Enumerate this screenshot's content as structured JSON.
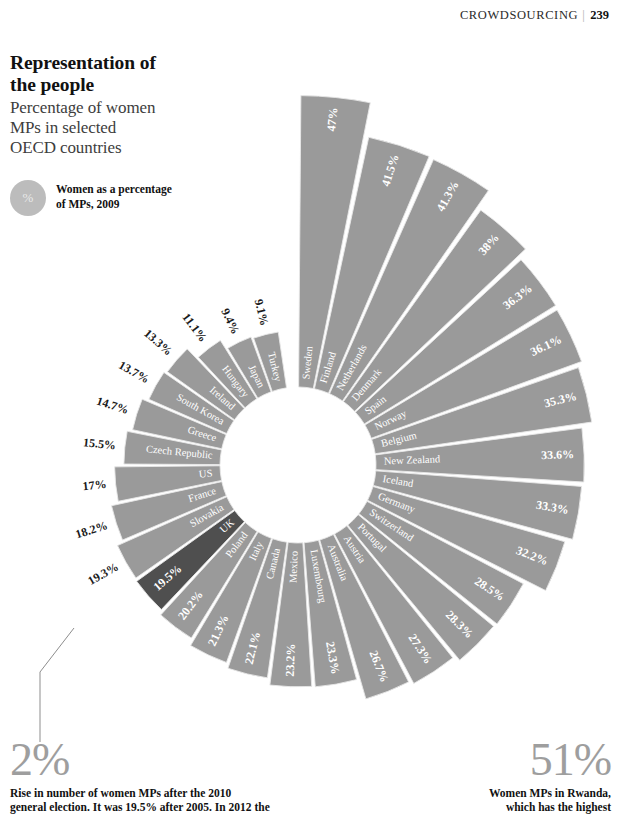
{
  "header": {
    "section": "CROWDSOURCING",
    "page": "239"
  },
  "title": {
    "main_line1": "Representation of",
    "main_line2": "the people",
    "sub_line1": "Percentage of women",
    "sub_line2": "MPs in selected",
    "sub_line3": "OECD countries"
  },
  "legend": {
    "swatch_symbol": "%",
    "line1": "Women as a percentage",
    "line2": "of MPs, 2009"
  },
  "stats": {
    "left": {
      "value": "2%",
      "line1": "Rise in number of women MPs after the 2010",
      "line2": "general election. It was 19.5% after 2005. In 2012 the"
    },
    "right": {
      "value": "51%",
      "line1": "Women MPs in Rwanda,",
      "line2": "which has the highest"
    }
  },
  "colors": {
    "segment": "#9a9a9a",
    "highlight": "#4f4f4f",
    "segment_stroke": "#e8e8e8",
    "label_light": "#ffffff",
    "label_dark": "#1a1a1a",
    "accent_gray": "#9e9e9e"
  },
  "chart_data": {
    "type": "pie",
    "variant": "radial-bar-rose",
    "title": "Representation of the people",
    "subtitle": "Percentage of women MPs in selected OECD countries",
    "unit": "%",
    "value_label": "Women as a percentage of MPs, 2009",
    "inner_radius_px": 78,
    "scale_px_per_percent": 6.2,
    "start_angle_deg": -90,
    "sweep_total_deg": 352,
    "highlight_country": "UK",
    "categories": [
      "Sweden",
      "Finland",
      "Netherlands",
      "Denmark",
      "Spain",
      "Norway",
      "Belgium",
      "New Zealand",
      "Iceland",
      "Germany",
      "Switzerland",
      "Portugal",
      "Austria",
      "Australia",
      "Luxembourg",
      "Mexico",
      "Canada",
      "Italy",
      "Poland",
      "UK",
      "Slovakia",
      "France",
      "US",
      "Czech Republic",
      "Greece",
      "South Korea",
      "Ireland",
      "Hungary",
      "Japan",
      "Turkey"
    ],
    "values": [
      47,
      41.5,
      41.3,
      38,
      36.3,
      36.1,
      35.3,
      33.6,
      33.3,
      32.2,
      28.5,
      28.3,
      27.3,
      26.7,
      23.3,
      23.2,
      22.1,
      21.3,
      20.2,
      19.5,
      19.3,
      18.2,
      17,
      15.5,
      14.7,
      13.7,
      13.3,
      11.1,
      9.4,
      9.1
    ],
    "value_labels": [
      "47%",
      "41.5%",
      "41.3%",
      "38%",
      "36.3%",
      "36.1%",
      "35.3%",
      "33.6%",
      "33.3%",
      "32.2%",
      "28.5%",
      "28.3%",
      "27.3%",
      "26.7%",
      "23.3%",
      "23.2%",
      "22.1%",
      "21.3%",
      "20.2%",
      "19.5%",
      "19.3%",
      "18.2%",
      "17%",
      "15.5%",
      "14.7%",
      "13.7%",
      "13.3%",
      "11.1%",
      "9.4%",
      "9.1%"
    ],
    "xlabel": "",
    "ylabel": "Percentage of MPs who are women (%)",
    "legend": "Women as a percentage of MPs, 2009",
    "grid": false
  }
}
